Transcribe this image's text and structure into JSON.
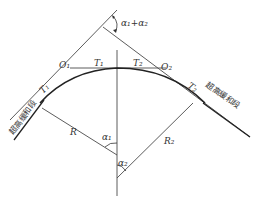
{
  "diagram": {
    "type": "compound-curve-geometry",
    "labels": {
      "apex_angle": "α₁+α₂",
      "o1": "O₁",
      "o2": "O₂",
      "t1_left": "T₁",
      "t1_mid": "T₁",
      "t2_mid": "T₂",
      "t2_right": "T₂",
      "r": "R",
      "r2": "R₂",
      "alpha1": "α₁",
      "alpha2": "α₂",
      "transition_left": "超高缓和段",
      "transition_right": "超高缓和段"
    },
    "colors": {
      "line": "#4a4a4a",
      "curve": "#222222",
      "text": "#333333",
      "background": "#ffffff"
    }
  }
}
